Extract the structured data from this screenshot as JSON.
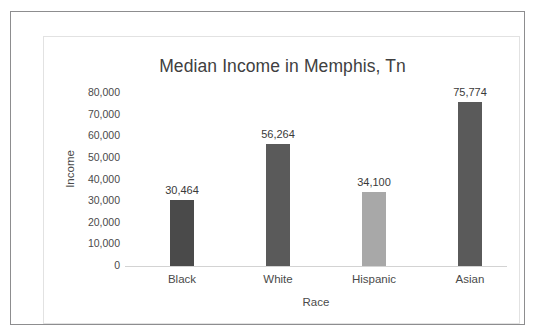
{
  "chart_data": {
    "type": "bar",
    "title": "Median Income in Memphis, Tn",
    "xlabel": "Race",
    "ylabel": "Income",
    "categories": [
      "Black",
      "White",
      "Hispanic",
      "Asian"
    ],
    "values": [
      30464,
      56264,
      34100,
      75774
    ],
    "value_labels": [
      "30,464",
      "56,264",
      "34,100",
      "75,774"
    ],
    "bar_colors": [
      "#4a4a4a",
      "#5a5a5a",
      "#a8a8a8",
      "#5a5a5a"
    ],
    "ylim": [
      0,
      80000
    ],
    "ytick_values": [
      80000,
      70000,
      60000,
      50000,
      40000,
      30000,
      20000,
      10000,
      0
    ],
    "ytick_labels": [
      "80,000",
      "70,000",
      "60,000",
      "50,000",
      "40,000",
      "30,000",
      "20,000",
      "10,000",
      "0"
    ],
    "grid": false,
    "legend": false,
    "data_labels": true,
    "axis_line_color": "#d3d3d3"
  },
  "frame": {
    "outer_border_color": "#8d8d8f",
    "chart_border_color": "#e2e2e2",
    "background_color": "#ffffff"
  }
}
